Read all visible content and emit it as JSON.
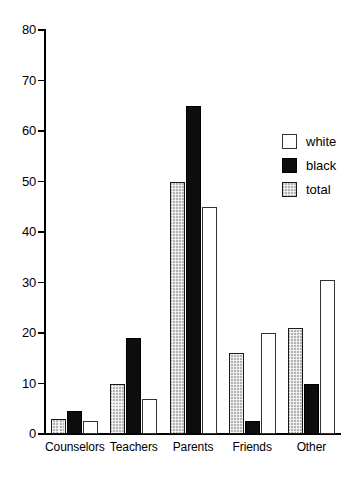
{
  "chart_data": {
    "type": "bar",
    "title": "",
    "subtitle": "",
    "xlabel": "",
    "ylabel": "",
    "ylim": [
      0,
      80
    ],
    "yticks": [
      0,
      10,
      20,
      30,
      40,
      50,
      60,
      70,
      80
    ],
    "grid": false,
    "legend_position": "upper right",
    "categories": [
      "Counselors",
      "Teachers",
      "Parents",
      "Friends",
      "Other"
    ],
    "series": [
      {
        "name": "total",
        "style": "gray-hatched",
        "values": [
          3,
          10,
          50,
          16,
          21
        ]
      },
      {
        "name": "black",
        "style": "solid-black",
        "values": [
          4.5,
          19,
          65,
          2.5,
          10
        ]
      },
      {
        "name": "white",
        "style": "open-white",
        "values": [
          2.5,
          7,
          45,
          20,
          30.5
        ]
      }
    ],
    "legend": [
      {
        "label": "white",
        "style": "open-white"
      },
      {
        "label": "black",
        "style": "solid-black"
      },
      {
        "label": "total",
        "style": "gray-hatched"
      }
    ]
  },
  "colors": {
    "axis": "#000000",
    "black_bar": "#0d0d0d",
    "gray_bar": "#b3b3b3",
    "white_bar": "#ffffff",
    "background": "#ffffff"
  }
}
